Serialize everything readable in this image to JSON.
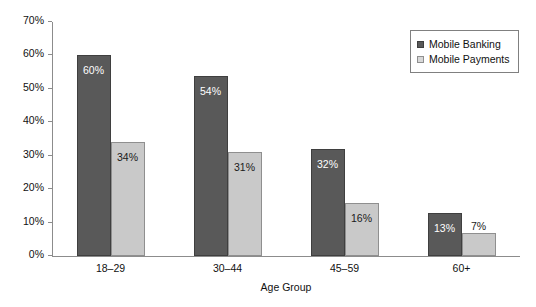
{
  "chart_data": {
    "type": "bar",
    "title": "",
    "subtitle": "",
    "xlabel": "Age Group",
    "ylabel": "",
    "categories": [
      "18–29",
      "30–44",
      "45–59",
      "60+"
    ],
    "series": [
      {
        "name": "Mobile Banking",
        "color": "#595959",
        "values": [
          60,
          54,
          32,
          13
        ],
        "labels": [
          "60%",
          "54%",
          "32%",
          "13%"
        ]
      },
      {
        "name": "Mobile Payments",
        "color": "#c9c9c9",
        "values": [
          34,
          31,
          16,
          7
        ],
        "labels": [
          "34%",
          "31%",
          "16%",
          "7%"
        ]
      }
    ],
    "ylim": [
      0,
      70
    ],
    "ytick_values": [
      0,
      10,
      20,
      30,
      40,
      50,
      60,
      70
    ],
    "ytick_labels": [
      "0%",
      "10%",
      "20%",
      "30%",
      "40%",
      "50%",
      "60%",
      "70%"
    ],
    "grid": false,
    "legend_position": "top-right",
    "value_label_format": "percent"
  },
  "legend": {
    "entries": [
      {
        "label": "Mobile Banking"
      },
      {
        "label": "Mobile Payments"
      }
    ]
  }
}
